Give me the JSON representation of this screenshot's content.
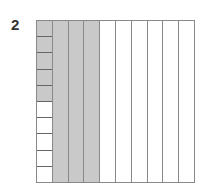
{
  "problem": {
    "number": "2"
  },
  "grid": {
    "rows": 10,
    "columns": 10,
    "shaded_full_columns": 3,
    "shaded_cells_in_first_column": 5,
    "shaded_total_hundredths": 35,
    "colors": {
      "shaded": "#c9c9c9",
      "unshaded": "#ffffff",
      "lines": "#888888"
    }
  }
}
